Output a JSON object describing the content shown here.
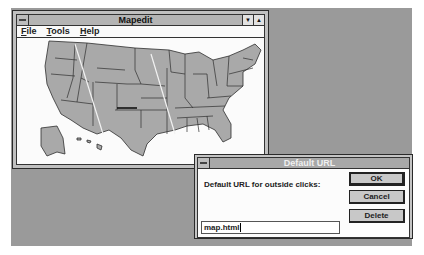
{
  "mapedit_window": {
    "title": "Mapedit",
    "minimize_glyph": "▼",
    "maximize_glyph": "▲",
    "menu": [
      {
        "label": "File",
        "accel": "F",
        "rest": "ile"
      },
      {
        "label": "Tools",
        "accel": "T",
        "rest": "ools"
      },
      {
        "label": "Help",
        "accel": "H",
        "rest": "elp"
      }
    ],
    "content": "us-states-map-image"
  },
  "dialog": {
    "title": "Default URL",
    "prompt": "Default URL for outside clicks:",
    "url_value": "map.html",
    "buttons": {
      "ok": "OK",
      "cancel": "Cancel",
      "delete": "Delete"
    }
  },
  "colors": {
    "desktop": "#9a9a9a",
    "window_frame": "#c0c0c0",
    "map_fill": "#a9a9a9",
    "map_border": "#333333"
  }
}
